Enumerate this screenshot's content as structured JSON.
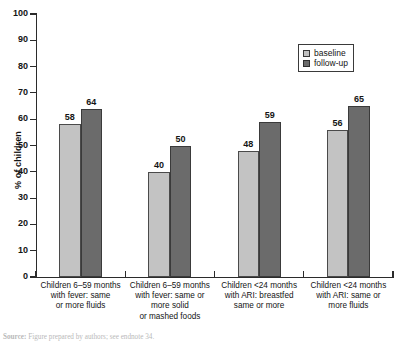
{
  "chart_data": {
    "type": "bar",
    "title": "",
    "xlabel": "",
    "ylabel": "% of children",
    "ylim": [
      0,
      100
    ],
    "ytick_step": 10,
    "yticks": [
      100,
      90,
      80,
      70,
      60,
      50,
      40,
      30,
      20,
      10,
      0
    ],
    "grid": false,
    "legend_position": "top-right",
    "categories": [
      "Children 6–59 months with fever: same or more fluids",
      "Children 6–59 months with fever: same or more solid or mashed foods",
      "Children <24 months with ARI: breastfed same or more",
      "Children <24 months with ARI: same or more fluids"
    ],
    "category_lines": [
      [
        "Children 6–59 months",
        "with fever: same",
        "or more fluids"
      ],
      [
        "Children 6–59 months",
        "with fever: same or",
        "more solid",
        "or mashed foods"
      ],
      [
        "Children <24 months",
        "with ARI: breastfed",
        "same or more"
      ],
      [
        "Children <24 months",
        "with ARI: same or",
        "more fluids"
      ]
    ],
    "series": [
      {
        "name": "baseline",
        "color": "#c3c3c3",
        "values": [
          58,
          40,
          48,
          56
        ]
      },
      {
        "name": "follow-up",
        "color": "#6b6b6b",
        "values": [
          64,
          50,
          59,
          65
        ]
      }
    ]
  },
  "legend": {
    "items": [
      {
        "label": "baseline"
      },
      {
        "label": "follow-up"
      }
    ]
  },
  "source": {
    "prefix": "Source:",
    "text": "Figure prepared by authors; see endnote 34."
  }
}
